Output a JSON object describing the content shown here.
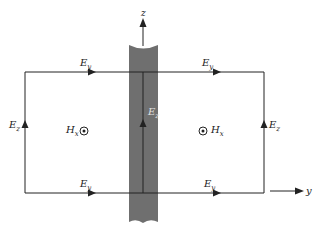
{
  "diagram": {
    "colors": {
      "line": "#222222",
      "slab": "#6f6f6f",
      "background": "#ffffff"
    },
    "axes": {
      "z_label": "z",
      "y_label": "y"
    },
    "labels": {
      "top_left_field": "E",
      "top_left_sub": "y",
      "top_right_field": "E",
      "top_right_sub": "y",
      "bottom_left_field": "E",
      "bottom_left_sub": "y",
      "bottom_right_field": "E",
      "bottom_right_sub": "y",
      "left_side_field": "E",
      "left_side_sub": "z",
      "right_side_field": "E",
      "right_side_sub": "z",
      "center_field": "E",
      "center_sub": "z",
      "left_magnetic": "H",
      "left_magnetic_sub": "x",
      "right_magnetic": "H",
      "right_magnetic_sub": "x"
    },
    "icons": {
      "out_of_page": "dot-in-circle-icon",
      "direction_arrow": "arrowhead-icon"
    }
  }
}
